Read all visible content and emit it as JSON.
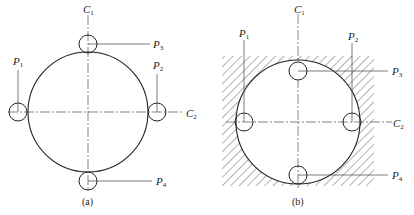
{
  "figure": {
    "panels": [
      {
        "id": "a",
        "caption": "(a)",
        "labels": {
          "C1": {
            "base": "C",
            "sub": "1"
          },
          "C2": {
            "base": "C",
            "sub": "2"
          },
          "P1": {
            "base": "P",
            "sub": "1"
          },
          "P2": {
            "base": "P",
            "sub": "2"
          },
          "P3": {
            "base": "P",
            "sub": "3"
          },
          "P4": {
            "base": "P",
            "sub": "4"
          }
        }
      },
      {
        "id": "b",
        "caption": "(b)",
        "labels": {
          "C1": {
            "base": "C",
            "sub": "1"
          },
          "C2": {
            "base": "C",
            "sub": "2"
          },
          "P1": {
            "base": "P",
            "sub": "1"
          },
          "P2": {
            "base": "P",
            "sub": "2"
          },
          "P3": {
            "base": "P",
            "sub": "3"
          },
          "P4": {
            "base": "P",
            "sub": "4"
          }
        }
      }
    ],
    "colors": {
      "stroke": "#222222",
      "axis": "#555555",
      "hatch": "#666666"
    }
  }
}
